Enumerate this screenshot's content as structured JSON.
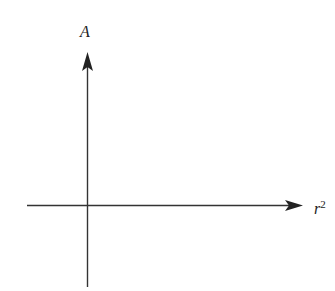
{
  "diagram": {
    "type": "axes",
    "y_axis": {
      "label": "A"
    },
    "x_axis": {
      "label_base": "r",
      "label_exponent": "2"
    },
    "colors": {
      "axis": "#333333",
      "text": "#222222",
      "background": "#ffffff"
    }
  }
}
